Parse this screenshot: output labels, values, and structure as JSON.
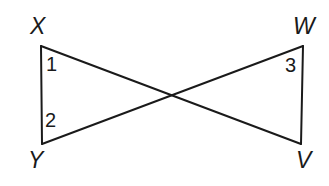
{
  "figure": {
    "background_color": "#ffffff",
    "stroke_color": "#1a1a1a",
    "stroke_width": 2,
    "vertices": [
      {
        "id": "X",
        "label": "X",
        "x": 41,
        "y": 46
      },
      {
        "id": "W",
        "label": "W",
        "x": 303,
        "y": 46
      },
      {
        "id": "Y",
        "label": "Y",
        "x": 42,
        "y": 144
      },
      {
        "id": "V",
        "label": "V",
        "x": 301,
        "y": 144
      }
    ],
    "intersection": {
      "x": 171,
      "y": 96
    },
    "segments": [
      {
        "id": "XY",
        "from": "X",
        "to": "Y"
      },
      {
        "id": "WV",
        "from": "W",
        "to": "V"
      },
      {
        "id": "XV",
        "from": "X",
        "to": "V"
      },
      {
        "id": "YW",
        "from": "Y",
        "to": "W"
      }
    ],
    "angle_labels": [
      {
        "id": "angle-1",
        "label": "1",
        "at_vertex": "X"
      },
      {
        "id": "angle-2",
        "label": "2",
        "at_vertex": "Y"
      },
      {
        "id": "angle-3",
        "label": "3",
        "at_vertex": "W"
      }
    ]
  }
}
